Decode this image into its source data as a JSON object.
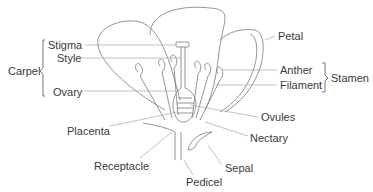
{
  "diagram": {
    "groups": {
      "carpel": "Carpel",
      "stamen": "Stamen"
    },
    "labels": {
      "stigma": "Stigma",
      "style": "Style",
      "ovary": "Ovary",
      "petal": "Petal",
      "anther": "Anther",
      "filament": "Filament",
      "ovules": "Ovules",
      "nectary": "Nectary",
      "placenta": "Placenta",
      "receptacle": "Receptacle",
      "sepal": "Sepal",
      "pedicel": "Pedicel"
    },
    "colors": {
      "text": "#3a3a3a",
      "outline": "#7a7a7a",
      "leader": "#a8a8a8"
    }
  }
}
